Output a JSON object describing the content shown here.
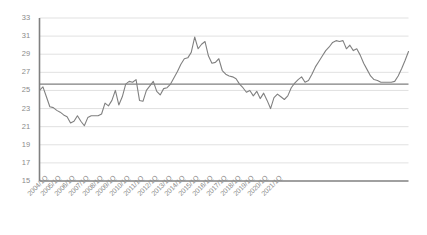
{
  "chart_data": {
    "type": "line",
    "title": "",
    "subtitle": "",
    "xlabel": "",
    "ylabel": "",
    "ylim": [
      15,
      33
    ],
    "ytick_step": 2,
    "yticks": [
      15,
      17,
      19,
      21,
      23,
      25,
      27,
      29,
      31,
      33
    ],
    "grid": true,
    "legend": "none",
    "line_color": "#808080",
    "gridline_color": "#d9d9d9",
    "axis_color": "#808080",
    "reference_line": {
      "value": 25.7,
      "color": "#7f7f7f",
      "label": ""
    },
    "xtick_labels": [
      "2004/1Q",
      "2005/1Q",
      "2006/1Q",
      "2007/1Q",
      "2008/1Q",
      "2009/1Q",
      "2010/1Q",
      "2011/1Q",
      "2012/1Q",
      "2013/1Q",
      "2014/1Q",
      "2015/1Q",
      "2016/1Q",
      "2017/1Q",
      "2018/1Q",
      "2019/1Q",
      "2020/1Q",
      "2021/1Q"
    ],
    "x_label_every": 4,
    "x_start": "2004/1Q",
    "x_end": "2021/4Q",
    "x_period": "quarterly",
    "values": [
      25.0,
      25.4,
      24.3,
      23.2,
      23.1,
      22.8,
      22.6,
      22.3,
      22.1,
      21.4,
      21.6,
      22.2,
      21.6,
      21.1,
      22.0,
      22.2,
      22.2,
      22.2,
      22.4,
      23.6,
      23.3,
      23.9,
      25.0,
      23.4,
      24.3,
      25.7,
      26.0,
      25.9,
      26.2,
      23.9,
      23.8,
      25.0,
      25.5,
      26.0,
      24.9,
      24.5,
      25.2,
      25.3,
      25.7,
      26.4,
      27.1,
      27.9,
      28.5,
      28.6,
      29.2,
      30.9,
      29.6,
      30.1,
      30.4,
      28.8,
      28.0,
      28.1,
      28.5,
      27.2,
      26.8,
      26.6,
      26.5,
      26.3,
      25.7,
      25.3,
      24.8,
      25.0,
      24.4,
      24.9,
      24.1,
      24.7,
      23.9,
      23.0,
      24.2,
      24.6,
      24.3,
      24.0,
      24.4,
      25.3,
      25.8,
      26.2,
      26.5,
      25.9,
      26.1,
      26.8,
      27.6,
      28.2,
      28.8,
      29.4,
      29.8,
      30.3,
      30.5,
      30.4,
      30.5,
      29.6,
      30.0,
      29.4,
      29.6,
      28.9,
      28.0,
      27.3,
      26.6,
      26.2,
      26.1,
      25.9,
      25.9,
      25.9,
      25.9,
      26.0,
      26.6,
      27.4,
      28.3,
      29.3
    ]
  }
}
